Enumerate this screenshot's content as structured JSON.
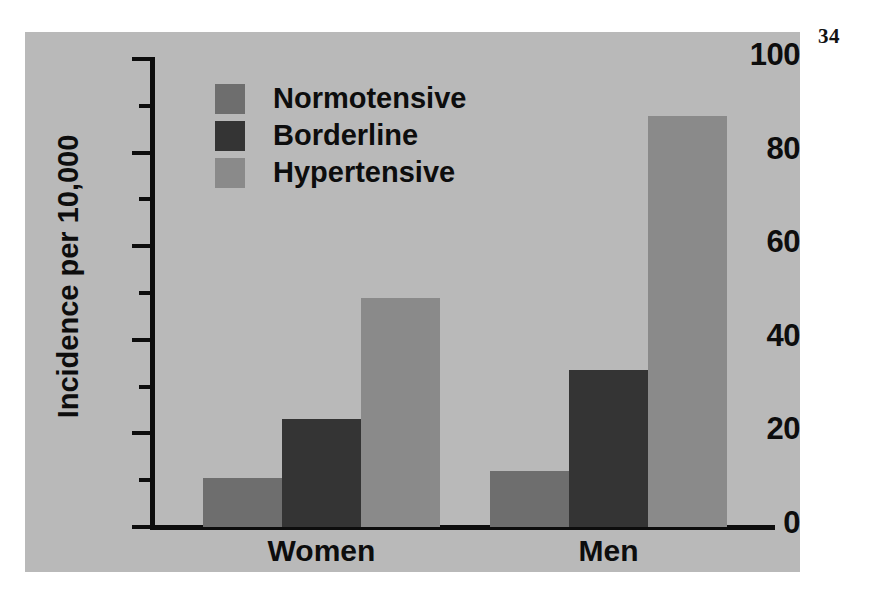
{
  "page": {
    "number": "34",
    "panel_background": "#b9b9b9",
    "ink_color": "#0d0d0d"
  },
  "chart_data": {
    "type": "bar",
    "title": "",
    "subtitle": "",
    "xlabel": "",
    "ylabel": "Incidence per 10,000",
    "categories": [
      "Women",
      "Men"
    ],
    "series": [
      {
        "name": "Normotensive",
        "color": "#6e6e6e",
        "values": [
          10.5,
          12.0
        ]
      },
      {
        "name": "Borderline",
        "color": "#343434",
        "values": [
          23.0,
          33.5
        ]
      },
      {
        "name": "Hypertensive",
        "color": "#8a8a8a",
        "values": [
          48.9,
          87.8
        ]
      }
    ],
    "ylim": [
      0,
      100
    ],
    "ytick_labels": [
      "0",
      "20",
      "40",
      "60",
      "80",
      "100"
    ],
    "ytick_values": [
      0,
      20,
      40,
      60,
      80,
      100
    ],
    "yminor_tick_values": [
      10,
      30,
      50,
      70,
      90
    ],
    "grid": false,
    "legend_position": "top-left-inside",
    "legend_entries": [
      "Normotensive",
      "Borderline",
      "Hypertensive"
    ]
  },
  "axis": {
    "y_title": "Incidence per 10,000",
    "ticks": [
      {
        "label": "100"
      },
      {
        "label": "80"
      },
      {
        "label": "60"
      },
      {
        "label": "40"
      },
      {
        "label": "20"
      },
      {
        "label": "0"
      }
    ]
  },
  "groups": [
    {
      "label": "Women"
    },
    {
      "label": "Men"
    }
  ],
  "legend": {
    "items": [
      {
        "label": "Normotensive",
        "color": "#6e6e6e"
      },
      {
        "label": "Borderline",
        "color": "#343434"
      },
      {
        "label": "Hypertensive",
        "color": "#8a8a8a"
      }
    ]
  }
}
